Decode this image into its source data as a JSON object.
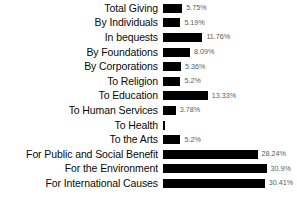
{
  "chart_data": {
    "type": "bar",
    "orientation": "horizontal",
    "title": "",
    "subtitle": "",
    "xlabel": "",
    "ylabel": "",
    "grid": false,
    "legend": "none",
    "value_suffix": "%",
    "xlim": [
      0,
      32
    ],
    "categories": [
      "Total Giving",
      "By Individuals",
      "In bequests",
      "By Foundations",
      "By Corporations",
      "To Religion",
      "To Education",
      "To Human Services",
      "To Health",
      "To the Arts",
      "For Public and Social Benefit",
      "For the Environment",
      "For International Causes"
    ],
    "values": [
      5.75,
      5.19,
      11.76,
      8.09,
      5.36,
      5.2,
      13.33,
      3.78,
      0.5,
      5.2,
      28.24,
      30.9,
      30.41
    ],
    "value_labels": [
      "5.75%",
      "5.19%",
      "11.76%",
      "8.09%",
      "5.36%",
      "5.2%",
      "13.33%",
      "3.78%",
      "",
      "5.2%",
      "28.24%",
      "30.9%",
      "30.41%"
    ],
    "bar_color": "#000000",
    "background_color": "#ffffff",
    "label_color": "#0a0a0a",
    "value_color": "#5c5c5c"
  }
}
